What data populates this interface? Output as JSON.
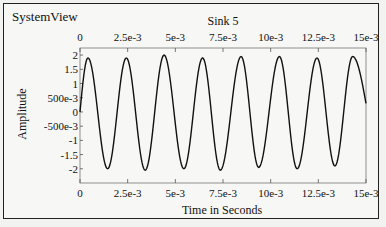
{
  "app_title": "SystemView",
  "chart_data": {
    "type": "line",
    "title": "Sink 5",
    "xlabel": "Time in Seconds",
    "ylabel": "Amplitude",
    "xlim": [
      0,
      0.015
    ],
    "ylim": [
      -2.5,
      2.25
    ],
    "grid": false,
    "legend": null,
    "x_ticks": [
      "0",
      "2.5e-3",
      "5e-3",
      "7.5e-3",
      "10e-3",
      "12.5e-3",
      "15e-3"
    ],
    "x_tick_values": [
      0,
      0.0025,
      0.005,
      0.0075,
      0.01,
      0.0125,
      0.015
    ],
    "y_ticks": [
      "2",
      "1.5",
      "1",
      "500e-3",
      "0",
      "-500e-3",
      "-1",
      "-1.5",
      "-2"
    ],
    "y_tick_values": [
      2,
      1.5,
      1,
      0.5,
      0,
      -0.5,
      -1,
      -1.5,
      -2
    ],
    "series": [
      {
        "name": "Sink 5",
        "description": "sinusoid, ~505 Hz, amplitude ~1.95",
        "key_points": {
          "x": [
            0,
            0.00042,
            0.00145,
            0.00243,
            0.00342,
            0.00441,
            0.00545,
            0.00643,
            0.00736,
            0.00845,
            0.00937,
            0.01046,
            0.01139,
            0.01243,
            0.01337,
            0.0143,
            0.015
          ],
          "y": [
            0.0,
            1.9,
            -2.0,
            1.9,
            -2.05,
            2.0,
            -2.0,
            1.9,
            -2.05,
            1.95,
            -1.95,
            1.95,
            -2.0,
            1.9,
            -1.9,
            1.95,
            0.3
          ]
        }
      }
    ]
  }
}
